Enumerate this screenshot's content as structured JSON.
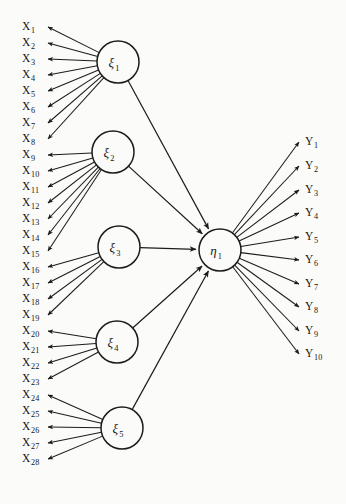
{
  "diagram": {
    "type": "structural-equation-model-path-diagram",
    "background_color": "#fbfbf9",
    "ink_color": "#1c1c1c",
    "exogenous_latents": [
      {
        "id": "xi1",
        "label": "ξ",
        "subscript": "1",
        "cx": 118,
        "cy": 62,
        "r": 21,
        "indicators": [
          "X1",
          "X2",
          "X3",
          "X4",
          "X5",
          "X6",
          "X7",
          "X8"
        ]
      },
      {
        "id": "xi2",
        "label": "ξ",
        "subscript": "2",
        "cx": 113,
        "cy": 152,
        "r": 21,
        "indicators": [
          "X9",
          "X10",
          "X11",
          "X12",
          "X13",
          "X14",
          "X15"
        ]
      },
      {
        "id": "xi3",
        "label": "ξ",
        "subscript": "3",
        "cx": 119,
        "cy": 247,
        "r": 21,
        "indicators": [
          "X16",
          "X17",
          "X18",
          "X19"
        ]
      },
      {
        "id": "xi4",
        "label": "ξ",
        "subscript": "4",
        "cx": 117,
        "cy": 342,
        "r": 21,
        "indicators": [
          "X20",
          "X21",
          "X22",
          "X23"
        ]
      },
      {
        "id": "xi5",
        "label": "ξ",
        "subscript": "5",
        "cx": 122,
        "cy": 428,
        "r": 21,
        "indicators": [
          "X24",
          "X25",
          "X26",
          "X27",
          "X28"
        ]
      }
    ],
    "endogenous_latents": [
      {
        "id": "eta1",
        "label": "η",
        "subscript": "1",
        "cx": 220,
        "cy": 250,
        "r": 21,
        "indicators": [
          "Y1",
          "Y2",
          "Y3",
          "Y4",
          "Y5",
          "Y6",
          "Y7",
          "Y8",
          "Y9",
          "Y10"
        ]
      }
    ],
    "x_indicators": [
      {
        "id": "X1",
        "base": "X",
        "subscript": "1",
        "x": 22,
        "y": 30
      },
      {
        "id": "X2",
        "base": "X",
        "subscript": "2",
        "x": 22,
        "y": 46
      },
      {
        "id": "X3",
        "base": "X",
        "subscript": "3",
        "x": 22,
        "y": 62
      },
      {
        "id": "X4",
        "base": "X",
        "subscript": "4",
        "x": 22,
        "y": 78
      },
      {
        "id": "X5",
        "base": "X",
        "subscript": "5",
        "x": 22,
        "y": 94
      },
      {
        "id": "X6",
        "base": "X",
        "subscript": "6",
        "x": 22,
        "y": 110
      },
      {
        "id": "X7",
        "base": "X",
        "subscript": "7",
        "x": 22,
        "y": 126
      },
      {
        "id": "X8",
        "base": "X",
        "subscript": "8",
        "x": 22,
        "y": 142
      },
      {
        "id": "X9",
        "base": "X",
        "subscript": "9",
        "x": 22,
        "y": 158
      },
      {
        "id": "X10",
        "base": "X",
        "subscript": "10",
        "x": 22,
        "y": 174
      },
      {
        "id": "X11",
        "base": "X",
        "subscript": "11",
        "x": 22,
        "y": 190
      },
      {
        "id": "X12",
        "base": "X",
        "subscript": "12",
        "x": 22,
        "y": 206
      },
      {
        "id": "X13",
        "base": "X",
        "subscript": "13",
        "x": 22,
        "y": 222
      },
      {
        "id": "X14",
        "base": "X",
        "subscript": "14",
        "x": 22,
        "y": 238
      },
      {
        "id": "X15",
        "base": "X",
        "subscript": "15",
        "x": 22,
        "y": 254
      },
      {
        "id": "X16",
        "base": "X",
        "subscript": "16",
        "x": 22,
        "y": 270
      },
      {
        "id": "X17",
        "base": "X",
        "subscript": "17",
        "x": 22,
        "y": 286
      },
      {
        "id": "X18",
        "base": "X",
        "subscript": "18",
        "x": 22,
        "y": 302
      },
      {
        "id": "X19",
        "base": "X",
        "subscript": "19",
        "x": 22,
        "y": 318
      },
      {
        "id": "X20",
        "base": "X",
        "subscript": "20",
        "x": 22,
        "y": 334
      },
      {
        "id": "X21",
        "base": "X",
        "subscript": "21",
        "x": 22,
        "y": 350
      },
      {
        "id": "X22",
        "base": "X",
        "subscript": "22",
        "x": 22,
        "y": 366
      },
      {
        "id": "X23",
        "base": "X",
        "subscript": "23",
        "x": 22,
        "y": 382
      },
      {
        "id": "X24",
        "base": "X",
        "subscript": "24",
        "x": 22,
        "y": 398
      },
      {
        "id": "X25",
        "base": "X",
        "subscript": "25",
        "x": 22,
        "y": 414
      },
      {
        "id": "X26",
        "base": "X",
        "subscript": "26",
        "x": 22,
        "y": 430
      },
      {
        "id": "X27",
        "base": "X",
        "subscript": "27",
        "x": 22,
        "y": 446
      },
      {
        "id": "X28",
        "base": "X",
        "subscript": "28",
        "x": 22,
        "y": 462
      }
    ],
    "y_indicators": [
      {
        "id": "Y1",
        "base": "Y",
        "subscript": "1",
        "x": 305,
        "y": 145
      },
      {
        "id": "Y2",
        "base": "Y",
        "subscript": "2",
        "x": 305,
        "y": 169
      },
      {
        "id": "Y3",
        "base": "Y",
        "subscript": "3",
        "x": 305,
        "y": 193
      },
      {
        "id": "Y4",
        "base": "Y",
        "subscript": "4",
        "x": 305,
        "y": 216
      },
      {
        "id": "Y5",
        "base": "Y",
        "subscript": "5",
        "x": 305,
        "y": 240
      },
      {
        "id": "Y6",
        "base": "Y",
        "subscript": "6",
        "x": 305,
        "y": 263
      },
      {
        "id": "Y7",
        "base": "Y",
        "subscript": "7",
        "x": 305,
        "y": 287
      },
      {
        "id": "Y8",
        "base": "Y",
        "subscript": "8",
        "x": 305,
        "y": 310
      },
      {
        "id": "Y9",
        "base": "Y",
        "subscript": "9",
        "x": 305,
        "y": 334
      },
      {
        "id": "Y10",
        "base": "Y",
        "subscript": "10",
        "x": 305,
        "y": 357
      }
    ],
    "structural_paths": [
      {
        "from": "xi1",
        "to": "eta1"
      },
      {
        "from": "xi2",
        "to": "eta1"
      },
      {
        "from": "xi3",
        "to": "eta1"
      },
      {
        "from": "xi4",
        "to": "eta1"
      },
      {
        "from": "xi5",
        "to": "eta1"
      }
    ]
  }
}
